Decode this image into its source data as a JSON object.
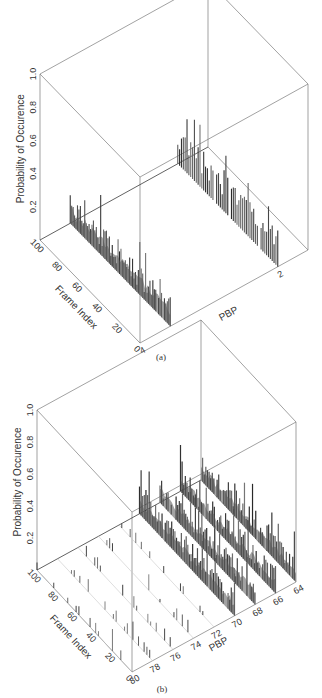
{
  "chart_data": [
    {
      "panel": "a",
      "caption": "(a)",
      "type": "bar3d",
      "zlabel": "Probability of Occurence",
      "ylabel": "Frame Index",
      "xlabel": "PBP",
      "zlim": [
        0,
        1.0
      ],
      "zticks": [
        "0.2",
        "0.4",
        "0.6",
        "0.8",
        "1.0"
      ],
      "yticks": [
        "0",
        "20",
        "40",
        "60",
        "80",
        "100"
      ],
      "xticks": [
        "4",
        "2"
      ],
      "series": [
        {
          "name": "PBP 4",
          "description": "dense bars across frames 0-100, mostly 0.05-0.25, peaks ~0.37"
        },
        {
          "name": "PBP 2",
          "description": "bars across frames 0-100, mostly 0.1-0.3, peaks ~0.35"
        }
      ]
    },
    {
      "panel": "b",
      "caption": "(b)",
      "type": "bar3d",
      "zlabel": "Probability of Occurence",
      "ylabel": "Frame Index",
      "xlabel": "PBP",
      "zlim": [
        0,
        1.0
      ],
      "zticks": [
        "0.2",
        "0.4",
        "0.6",
        "0.8",
        "1.0"
      ],
      "yticks": [
        "0",
        "20",
        "40",
        "60",
        "80",
        "100"
      ],
      "xticks": [
        "80",
        "78",
        "76",
        "74",
        "72",
        "70",
        "68",
        "66",
        "64"
      ],
      "series": [
        {
          "name": "PBP 64-70",
          "description": "dense bars, mostly 0.05-0.2, peaks ~0.3"
        },
        {
          "name": "PBP 72-80",
          "description": "sparse small bars, mostly < 0.1"
        }
      ]
    }
  ]
}
